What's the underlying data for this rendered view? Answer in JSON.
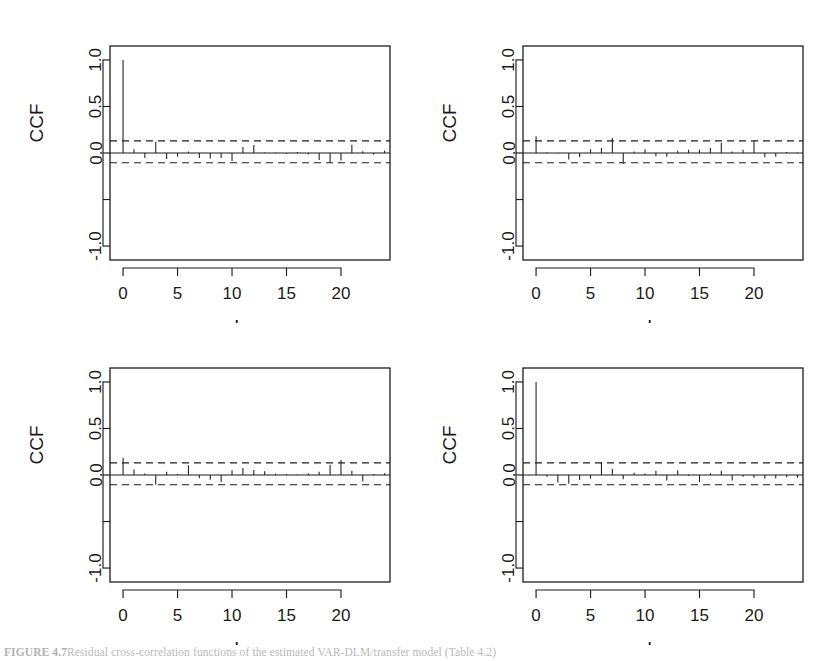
{
  "figure": {
    "caption_label": "FIGURE 4.7",
    "caption_text": "Residual cross-correlation functions of the estimated VAR-DLM/transfer model (Table 4.2)",
    "panel_count": 4,
    "layout": "2x2"
  },
  "axes": {
    "ylabel": "CCF",
    "xlabel": "Lag",
    "y_ticks": [
      "1.0",
      "0.5",
      "0.0",
      "",
      "-1.0"
    ],
    "y_tick_values": [
      1.0,
      0.5,
      0.0,
      -0.5,
      -1.0
    ],
    "x_ticks": [
      "0",
      "5",
      "10",
      "15",
      "20"
    ],
    "x_tick_values": [
      0,
      5,
      10,
      15,
      20
    ],
    "ylim": [
      -1.15,
      1.15
    ],
    "xlim": [
      -1.2,
      24.5
    ],
    "conf_level": 0.13,
    "grid": false,
    "frame": true
  },
  "chart_data": [
    {
      "type": "bar",
      "title": "",
      "panel_index": 0,
      "panel_position": "top-left",
      "xlabel": "Lag",
      "ylabel": "CCF",
      "ylim": [
        -1.15,
        1.15
      ],
      "xlim": [
        -1.2,
        24.5
      ],
      "grid": false,
      "conf_bounds": [
        0.13,
        -0.105
      ],
      "categories": [
        0,
        1,
        2,
        3,
        4,
        5,
        6,
        7,
        8,
        9,
        10,
        11,
        12,
        13,
        14,
        15,
        16,
        17,
        18,
        19,
        20,
        21,
        22,
        23,
        24
      ],
      "values": [
        1.0,
        0.04,
        -0.055,
        0.12,
        -0.065,
        -0.04,
        0.015,
        -0.055,
        -0.06,
        -0.055,
        -0.085,
        0.065,
        0.085,
        0.005,
        0.005,
        -0.01,
        0.01,
        -0.015,
        -0.075,
        -0.105,
        -0.08,
        0.09,
        0.02,
        -0.02,
        0.025
      ]
    },
    {
      "type": "bar",
      "title": "",
      "panel_index": 1,
      "panel_position": "top-right",
      "xlabel": "Lag",
      "ylabel": "CCF",
      "ylim": [
        -1.15,
        1.15
      ],
      "xlim": [
        -1.2,
        24.5
      ],
      "grid": false,
      "conf_bounds": [
        0.13,
        -0.105
      ],
      "categories": [
        0,
        1,
        2,
        3,
        4,
        5,
        6,
        7,
        8,
        9,
        10,
        11,
        12,
        13,
        14,
        15,
        16,
        17,
        18,
        19,
        20,
        21,
        22,
        23,
        24
      ],
      "values": [
        0.18,
        0.005,
        -0.005,
        -0.07,
        -0.045,
        0.04,
        0.055,
        0.16,
        -0.115,
        0.015,
        0.04,
        -0.035,
        -0.04,
        0.025,
        0.035,
        0.035,
        0.055,
        0.11,
        0.015,
        0.035,
        0.13,
        -0.045,
        -0.04,
        0.01,
        0.005
      ]
    },
    {
      "type": "bar",
      "title": "",
      "panel_index": 2,
      "panel_position": "bottom-left",
      "xlabel": "Lag",
      "ylabel": "CCF",
      "ylim": [
        -1.15,
        1.15
      ],
      "xlim": [
        -1.2,
        24.5
      ],
      "grid": false,
      "conf_bounds": [
        0.13,
        -0.105
      ],
      "categories": [
        0,
        1,
        2,
        3,
        4,
        5,
        6,
        7,
        8,
        9,
        10,
        11,
        12,
        13,
        14,
        15,
        16,
        17,
        18,
        19,
        20,
        21,
        22,
        23,
        24
      ],
      "values": [
        0.185,
        0.06,
        0.015,
        -0.105,
        0.035,
        0.01,
        0.105,
        -0.035,
        -0.05,
        -0.075,
        0.05,
        0.075,
        0.055,
        0.04,
        0.015,
        0.01,
        0.005,
        0.02,
        0.035,
        0.11,
        0.16,
        0.045,
        -0.07,
        0.01,
        0.02
      ]
    },
    {
      "type": "bar",
      "title": "",
      "panel_index": 3,
      "panel_position": "bottom-right",
      "xlabel": "Lag",
      "ylabel": "CCF",
      "ylim": [
        -1.15,
        1.15
      ],
      "xlim": [
        -1.2,
        24.5
      ],
      "grid": false,
      "conf_bounds": [
        0.13,
        -0.105
      ],
      "categories": [
        0,
        1,
        2,
        3,
        4,
        5,
        6,
        7,
        8,
        9,
        10,
        11,
        12,
        13,
        14,
        15,
        16,
        17,
        18,
        19,
        20,
        21,
        22,
        23,
        24
      ],
      "values": [
        1.0,
        -0.02,
        -0.08,
        -0.095,
        -0.055,
        -0.04,
        0.14,
        0.065,
        -0.045,
        0.025,
        0.015,
        0.045,
        -0.06,
        0.05,
        -0.01,
        -0.075,
        0.02,
        0.045,
        -0.06,
        -0.02,
        -0.03,
        -0.04,
        -0.035,
        -0.025,
        -0.03
      ]
    }
  ]
}
